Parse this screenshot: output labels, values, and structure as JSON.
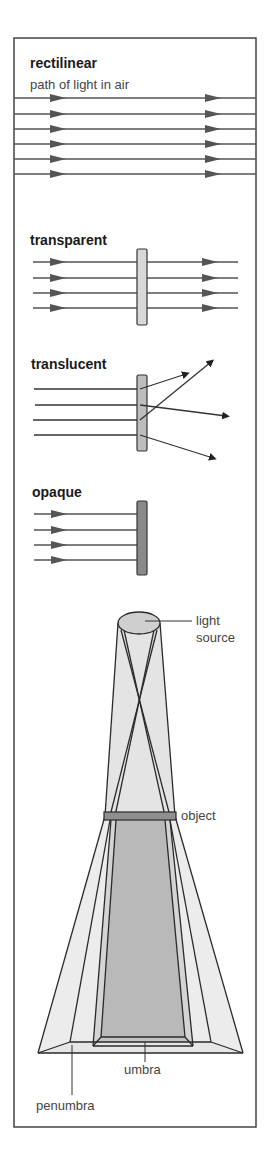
{
  "colors": {
    "frame": "#444444",
    "ray": "#555555",
    "transparent_slab": "#d8d8d8",
    "translucent_slab": "#bdbdbd",
    "opaque_slab": "#8a8a8a",
    "light_cone": "#e6e6e6",
    "penumbra": "#e9e9e9",
    "umbra": "#b9b9b9",
    "object": "#8f8f8f"
  },
  "sections": {
    "rectilinear": {
      "title": "rectilinear",
      "subtitle": "path of light in air",
      "ray_count": 6
    },
    "transparent": {
      "title": "transparent",
      "ray_count": 4
    },
    "translucent": {
      "title": "translucent",
      "ray_count": 4
    },
    "opaque": {
      "title": "opaque",
      "ray_count": 4
    },
    "shadow": {
      "labels": {
        "light": "light",
        "source": "source",
        "object": "object",
        "umbra": "umbra",
        "penumbra": "penumbra"
      }
    }
  }
}
